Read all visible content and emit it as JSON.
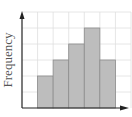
{
  "chart_data": {
    "type": "bar",
    "subtype": "histogram",
    "title": "",
    "xlabel": "",
    "ylabel": "Frequency",
    "categories": [
      "bin1",
      "bin2",
      "bin3",
      "bin4",
      "bin5"
    ],
    "values": [
      2,
      3,
      4,
      5,
      3
    ],
    "ylim": [
      0,
      6
    ],
    "x_grid_columns": 7,
    "bar_start_column": 1,
    "grid": true,
    "tick_labels_shown": false,
    "legend": null,
    "colors": {
      "bar_fill": "#bdbdbd",
      "bar_edge": "#8c8c8c",
      "grid": "#e0e0e0",
      "axis": "#222222"
    }
  },
  "labels": {
    "ylabel": "Frequency"
  }
}
